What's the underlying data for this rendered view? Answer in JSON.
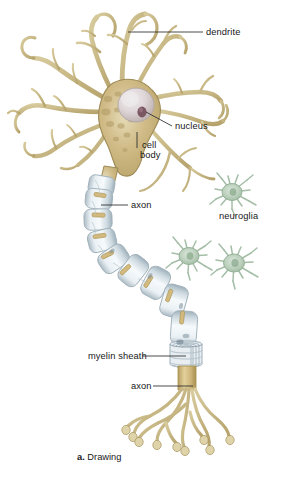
{
  "figure": {
    "caption_letter": "a.",
    "caption_text": "Drawing",
    "background_color": "#ffffff"
  },
  "labels": [
    {
      "id": "dendrite",
      "text": "dendrite",
      "x": 206,
      "y": 28
    },
    {
      "id": "nucleus",
      "text": "nucleus",
      "x": 175,
      "y": 122
    },
    {
      "id": "cell",
      "text": "cell",
      "x": 142,
      "y": 141
    },
    {
      "id": "body",
      "text": "body",
      "x": 140,
      "y": 151
    },
    {
      "id": "axon-upper",
      "text": "axon",
      "x": 131,
      "y": 202
    },
    {
      "id": "neuroglia",
      "text": "neuroglia",
      "x": 219,
      "y": 212
    },
    {
      "id": "myelin-sheath",
      "text": "myelin sheath",
      "x": 88,
      "y": 352
    },
    {
      "id": "axon-lower",
      "text": "axon",
      "x": 131,
      "y": 382
    }
  ],
  "colors": {
    "soma_fill": "#cbb583",
    "soma_edge": "#9d8a55",
    "soma_light": "#e4d7b0",
    "dendrite": "#c6b684",
    "dendrite_edge": "#9a8a56",
    "nucleus": "#ded7d9",
    "nucleus_edge": "#b3a9a6",
    "nucleolus": "#7a5763",
    "myelin": "#dfe6ea",
    "myelin_edge": "#a6b4bd",
    "myelin_shadow": "#b9c6cd",
    "axon_core": "#d2b97e",
    "neuroglia": "#c3d3c3",
    "neuroglia_edge": "#8fae93",
    "leader_line": "#2a2a2c",
    "text": "#18181a"
  },
  "anatomy": {
    "parts": [
      "dendrites",
      "cell body (soma)",
      "nucleus",
      "nucleolus",
      "axon",
      "myelin sheath",
      "nodes of Ranvier",
      "axon terminals",
      "neuroglia"
    ],
    "neuroglia_count": 3,
    "myelin_segment_count": 9,
    "axon_terminal_count": 8
  }
}
